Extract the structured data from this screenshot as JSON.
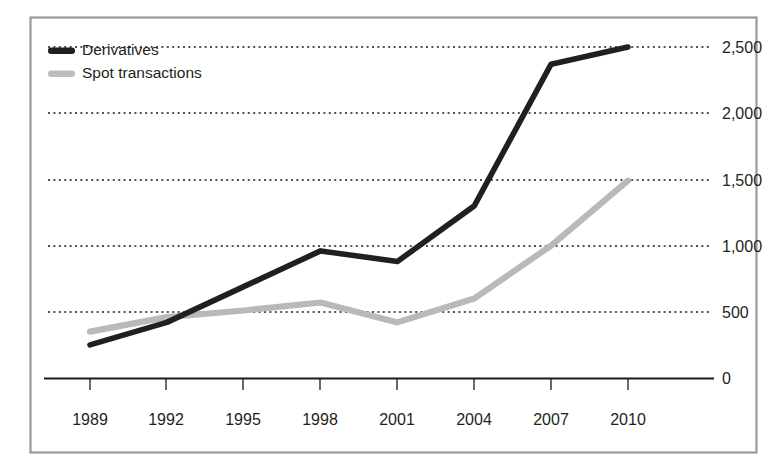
{
  "chart_data": {
    "type": "line",
    "title": "",
    "subtitle": "",
    "xlabel": "",
    "ylabel": "",
    "categories": [
      "1989",
      "1992",
      "1995",
      "1998",
      "2001",
      "2004",
      "2007",
      "2010"
    ],
    "x": [
      1989,
      1992,
      1995,
      1998,
      2001,
      2004,
      2007,
      2010
    ],
    "series": [
      {
        "name": "Derivatives",
        "color": "#231f20",
        "values": [
          250,
          420,
          690,
          960,
          880,
          1300,
          2370,
          2500
        ]
      },
      {
        "name": "Spot transactions",
        "color": "#bdbdbd",
        "values": [
          350,
          460,
          510,
          570,
          420,
          600,
          1000,
          1490
        ]
      }
    ],
    "ylim": [
      0,
      2500
    ],
    "yticks": [
      0,
      500,
      1000,
      1500,
      2000,
      2500
    ],
    "ytick_labels": [
      "0",
      "500",
      "1,000",
      "1,500",
      "2,000",
      "2,500"
    ],
    "y_axis_position": "right",
    "grid": true,
    "grid_style": "dotted-horizontal",
    "legend_position": "top-left",
    "legend": [
      "Derivatives",
      "Spot transactions"
    ]
  },
  "legend": {
    "items": [
      {
        "label": "Derivatives",
        "swatch": "legend-swatch-dark-icon"
      },
      {
        "label": "Spot transactions",
        "swatch": "legend-swatch-light-icon"
      }
    ]
  },
  "axes": {
    "y_labels": [
      "2,500",
      "2,000",
      "1,500",
      "1,000",
      "500",
      "0"
    ],
    "x_labels": [
      "1989",
      "1992",
      "1995",
      "1998",
      "2001",
      "2004",
      "2007",
      "2010"
    ]
  },
  "colors": {
    "derivatives": "#231f20",
    "spot": "#bdbdbd",
    "frame": "#9a9a9a",
    "grid": "#1a1a1a",
    "background": "#ffffff"
  }
}
